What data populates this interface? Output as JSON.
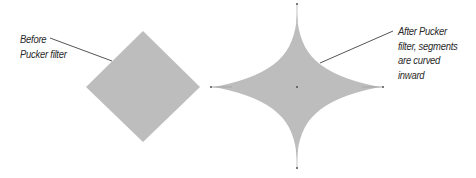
{
  "figure": {
    "background": "#ffffff",
    "shape_fill": "#bdbdbd",
    "leader_color": "#555555",
    "anchor_color": "#7a7a7a"
  },
  "before": {
    "label_lines": [
      "Before",
      "Pucker filter"
    ],
    "shape": "diamond",
    "vertices": {
      "top": [
        143,
        31
      ],
      "right": [
        200,
        87
      ],
      "bottom": [
        143,
        142
      ],
      "left": [
        86,
        87
      ]
    }
  },
  "after": {
    "label_lines": [
      "After Pucker",
      "filter, segments",
      "are curved",
      "inward"
    ],
    "shape": "four-point star (puckered)",
    "center": [
      297,
      87
    ],
    "anchors": {
      "top": [
        297,
        4
      ],
      "right": [
        383,
        87
      ],
      "bottom": [
        297,
        168
      ],
      "left": [
        211,
        87
      ]
    }
  }
}
